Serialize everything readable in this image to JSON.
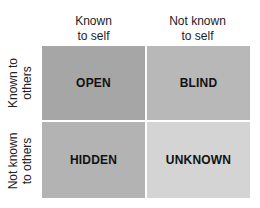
{
  "diagram": {
    "title": "",
    "columns": [
      {
        "line1": "Known",
        "line2": "to self"
      },
      {
        "line1": "Not known",
        "line2": "to self"
      }
    ],
    "rows": [
      {
        "line1": "Known to",
        "line2": "others"
      },
      {
        "line1": "Not known",
        "line2": "to others"
      }
    ],
    "quadrants": [
      {
        "label": "OPEN",
        "color": "#a6a6a6"
      },
      {
        "label": "BLIND",
        "color": "#b8b8b8"
      },
      {
        "label": "HIDDEN",
        "color": "#b3b3b3"
      },
      {
        "label": "UNKNOWN",
        "color": "#d4d4d4"
      }
    ]
  }
}
